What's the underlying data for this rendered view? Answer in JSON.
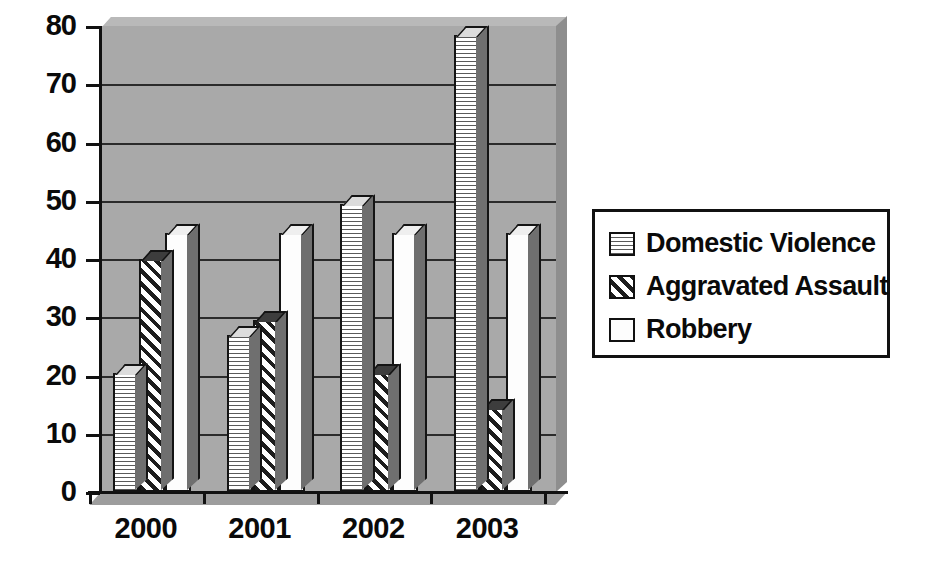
{
  "chart_data": {
    "type": "bar",
    "title": "",
    "subtitle": "",
    "xlabel": "",
    "ylabel": "",
    "categories": [
      "2000",
      "2001",
      "2002",
      "2003"
    ],
    "series": [
      {
        "name": "Domestic Violence",
        "pattern": "horizontal-lines",
        "values": [
          20.5,
          27,
          49.5,
          78.5
        ]
      },
      {
        "name": "Aggravated Assault",
        "pattern": "diagonal-hatch",
        "values": [
          40,
          29.5,
          20.5,
          14.5
        ]
      },
      {
        "name": "Robbery",
        "pattern": "solid-white",
        "values": [
          44.5,
          44.5,
          44.5,
          44.5
        ]
      }
    ],
    "ylim": [
      0,
      80
    ],
    "ytick_values": [
      0,
      10,
      20,
      30,
      40,
      50,
      60,
      70,
      80
    ],
    "ytick_labels": [
      "0",
      "10",
      "20",
      "30",
      "40",
      "50",
      "60",
      "70",
      "80"
    ],
    "grid": true,
    "grid_axis": "y",
    "legend_position": "right",
    "style": "3d-clustered-column",
    "plot_background": "#a9a9a9"
  },
  "legend": {
    "entries": [
      {
        "label": "Domestic Violence",
        "swatch": "legend-swatch-domestic-violence"
      },
      {
        "label": "Aggravated Assault",
        "swatch": "legend-swatch-aggravated-assault"
      },
      {
        "label": "Robbery",
        "swatch": "legend-swatch-robbery"
      }
    ]
  },
  "colors": {
    "plot_background": "#a9a9a9",
    "axis": "#111111",
    "gridline": "#2b2b2b",
    "bar_outline": "#141414",
    "bar_side": "#6f6f6f",
    "text": "#0a0a0a",
    "legend_background": "#ffffff"
  }
}
